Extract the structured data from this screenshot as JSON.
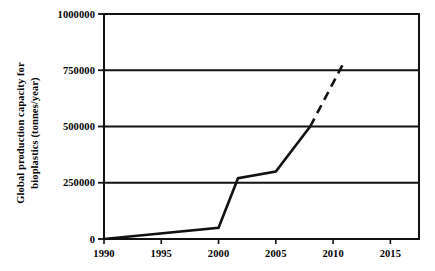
{
  "chart_data": {
    "type": "line",
    "title": "",
    "xlabel": "",
    "ylabel": "Global production capacity for bioplastics (tonnes/year)",
    "ylabel_line1": "Global production capacity for",
    "ylabel_line2": "bioplastics (tonnes/year)",
    "xlim": [
      1990,
      2017.5
    ],
    "ylim": [
      0,
      1000000
    ],
    "xticks": [
      1990,
      1995,
      2000,
      2005,
      2010,
      2015
    ],
    "xtick_labels": [
      "1990",
      "1995",
      "2000",
      "2005",
      "2010",
      "2015"
    ],
    "yticks": [
      0,
      250000,
      500000,
      750000,
      1000000
    ],
    "ytick_labels": [
      "0",
      "250000",
      "500000",
      "750000",
      "1000000"
    ],
    "grid": "horizontal",
    "legend": "none",
    "series": [
      {
        "name": "Historical (solid)",
        "style": "solid",
        "color": "#111111",
        "x": [
          1990,
          2000,
          2001.7,
          2005,
          2008
        ],
        "values": [
          0,
          50000,
          270000,
          300000,
          500000
        ]
      },
      {
        "name": "Projected (dashed)",
        "style": "dashed",
        "color": "#111111",
        "x": [
          2008,
          2011
        ],
        "values": [
          500000,
          790000
        ]
      }
    ]
  }
}
